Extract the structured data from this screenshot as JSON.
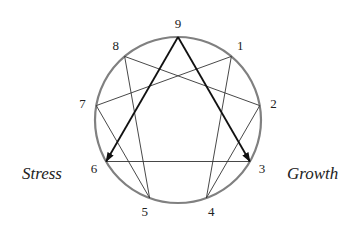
{
  "diagram": {
    "type": "enneagram",
    "colors": {
      "circle": "#808080",
      "lines": "#333333",
      "arrows": "#111111",
      "text": "#222222"
    },
    "center": [
      178,
      120
    ],
    "radius": 83,
    "points": [
      {
        "label": "9",
        "angle": 0
      },
      {
        "label": "1",
        "angle": 40
      },
      {
        "label": "2",
        "angle": 80
      },
      {
        "label": "3",
        "angle": 120
      },
      {
        "label": "4",
        "angle": 160
      },
      {
        "label": "5",
        "angle": 200
      },
      {
        "label": "6",
        "angle": 240
      },
      {
        "label": "7",
        "angle": 280
      },
      {
        "label": "8",
        "angle": 320
      }
    ],
    "triangle": [
      "9",
      "3",
      "6"
    ],
    "hexad": [
      "1",
      "4",
      "2",
      "8",
      "5",
      "7",
      "1"
    ],
    "arrows": [
      {
        "from": "9",
        "to": "6"
      },
      {
        "from": "9",
        "to": "3"
      }
    ],
    "labels": {
      "stress": "Stress",
      "growth": "Growth"
    }
  }
}
